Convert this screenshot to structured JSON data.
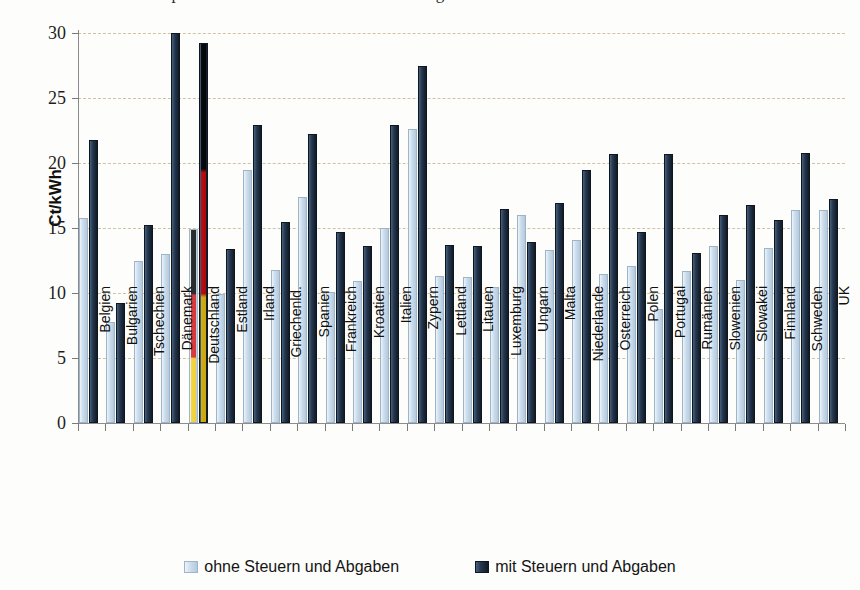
{
  "title_partial": "Strompreise für Haushaltskunden im EU-Vergleich",
  "chart_data": {
    "type": "bar",
    "title": "",
    "xlabel": "",
    "ylabel": "Ct/kWh",
    "ylim": [
      0,
      30
    ],
    "yticks": [
      0,
      5,
      10,
      15,
      20,
      25,
      30
    ],
    "grid": true,
    "legend_position": "bottom",
    "highlight_category": "Deutschland",
    "categories": [
      "Belgien",
      "Bulgarien",
      "Tschechien",
      "Dänemark",
      "Deutschland",
      "Estland",
      "Irland",
      "Griechenld.",
      "Spanien",
      "Frankreich",
      "Kroatien",
      "Italien",
      "Zypern",
      "Lettland",
      "Litauen",
      "Luxemburg",
      "Ungarn",
      "Malta",
      "Niederlande",
      "Österreich",
      "Polen",
      "Portugal",
      "Rumänien",
      "Slowenien",
      "Slowakei",
      "Finnland",
      "Schweden",
      "UK"
    ],
    "series": [
      {
        "name": "ohne Steuern und Abgaben",
        "color": "#cfe0ee",
        "values": [
          15.8,
          7.8,
          12.5,
          13.0,
          14.9,
          9.9,
          19.5,
          11.8,
          17.4,
          10.1,
          10.9,
          15.0,
          22.6,
          11.3,
          11.2,
          10.5,
          16.0,
          13.3,
          14.1,
          11.5,
          12.1,
          8.8,
          11.7,
          13.6,
          11.0,
          13.5,
          16.4,
          16.4
        ]
      },
      {
        "name": "mit Steuern und Abgaben",
        "color": "#1b2a3d",
        "values": [
          21.8,
          9.2,
          15.2,
          30.0,
          29.2,
          13.4,
          22.9,
          15.5,
          22.2,
          14.7,
          13.6,
          22.9,
          27.5,
          13.7,
          13.6,
          16.5,
          13.9,
          16.9,
          19.5,
          20.7,
          14.7,
          20.7,
          13.1,
          16.0,
          16.8,
          15.6,
          20.8,
          17.2
        ]
      }
    ]
  },
  "legend": [
    {
      "label": "ohne Steuern und Abgaben",
      "swatch": "light"
    },
    {
      "label": "mit Steuern und Abgaben",
      "swatch": "dark"
    }
  ],
  "colors": {
    "background": "#fdfdfb",
    "gridline": "#cfc3a4",
    "axis": "#8a8a8a",
    "series_light": "#cfe0ee",
    "series_dark": "#1b2a3d",
    "highlight_black": "#000000",
    "highlight_red": "#dd0000",
    "highlight_gold": "#ffce00"
  }
}
